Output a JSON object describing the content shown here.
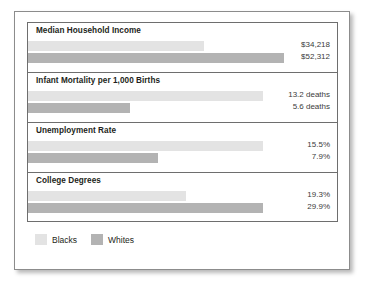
{
  "chart_data": {
    "type": "bar",
    "title": "",
    "orientation": "horizontal",
    "grid": false,
    "legend_position": "bottom-left",
    "categories": [
      "Median Household Income",
      "Infant Mortality per 1,000 Births",
      "Unemployment Rate",
      "College Degrees"
    ],
    "series": [
      {
        "name": "Blacks",
        "color": "#e3e3e3",
        "values": [
          34218,
          13.2,
          15.5,
          19.3
        ],
        "labels": [
          "$34,218",
          "13.2 deaths",
          "15.5%",
          "19.3%"
        ]
      },
      {
        "name": "Whites",
        "color": "#b3b3b3",
        "values": [
          52312,
          5.6,
          7.9,
          29.9
        ],
        "labels": [
          "$52,312",
          "5.6 deaths",
          "7.9%",
          "29.9%"
        ]
      }
    ],
    "groups": [
      {
        "title": "Median Household Income",
        "blacks_label": "$34,218",
        "whites_label": "$52,312",
        "blacks_value": 34218,
        "whites_value": 52312,
        "blacks_bar_width": "57%",
        "whites_bar_width": "83%"
      },
      {
        "title": "Infant Mortality per 1,000 Births",
        "blacks_label": "13.2 deaths",
        "whites_label": "5.6 deaths",
        "blacks_value": 13.2,
        "whites_value": 5.6,
        "blacks_bar_width": "76%",
        "whites_bar_width": "33%"
      },
      {
        "title": "Unemployment Rate",
        "blacks_label": "15.5%",
        "whites_label": "7.9%",
        "blacks_value": 15.5,
        "whites_value": 7.9,
        "blacks_bar_width": "76%",
        "whites_bar_width": "42%"
      },
      {
        "title": "College Degrees",
        "blacks_label": "19.3%",
        "whites_label": "29.9%",
        "blacks_value": 19.3,
        "whites_value": 29.9,
        "blacks_bar_width": "51%",
        "whites_bar_width": "76%"
      }
    ],
    "legend": [
      {
        "label": "Blacks",
        "color": "#e3e3e3"
      },
      {
        "label": "Whites",
        "color": "#b3b3b3"
      }
    ]
  }
}
